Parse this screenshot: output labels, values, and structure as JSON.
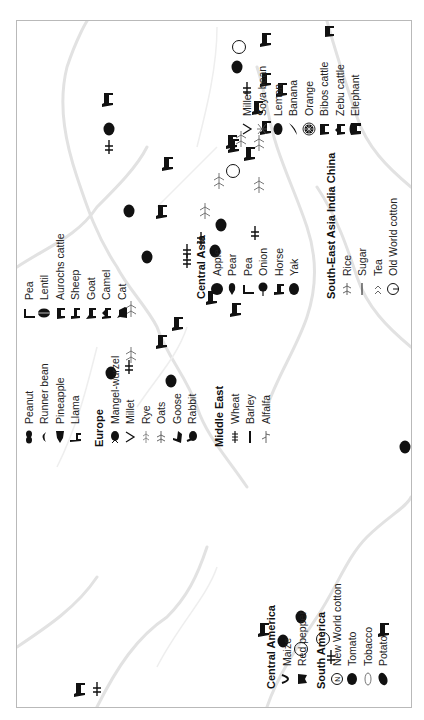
{
  "figure": {
    "orientation": "rotated-90-ccw",
    "frame_color": "#b9b9b9",
    "coastline_color": "#dcdcdc",
    "icon_color": "#111111"
  },
  "legend": {
    "central_america": {
      "title": "Central America",
      "items": [
        {
          "label": "Maize",
          "icon": "maize-icon"
        },
        {
          "label": "Red pepper",
          "icon": "red-pepper-icon"
        }
      ]
    },
    "south_america": {
      "title": "South America",
      "items": [
        {
          "label": "New World cotton",
          "icon": "new-world-cotton-icon"
        },
        {
          "label": "Tomato",
          "icon": "tomato-icon"
        },
        {
          "label": "Tobacco",
          "icon": "tobacco-icon"
        },
        {
          "label": "Potato",
          "icon": "potato-icon"
        }
      ]
    },
    "americas_extra": {
      "items": [
        {
          "label": "Peanut",
          "icon": "peanut-icon"
        },
        {
          "label": "Runner bean",
          "icon": "runner-bean-icon"
        },
        {
          "label": "Pineapple",
          "icon": "pineapple-icon"
        },
        {
          "label": "Llama",
          "icon": "llama-icon"
        }
      ]
    },
    "europe": {
      "title": "Europe",
      "items": [
        {
          "label": "Mangel-wurzel",
          "icon": "mangel-wurzel-icon"
        },
        {
          "label": "Millet",
          "icon": "millet-icon"
        },
        {
          "label": "Rye",
          "icon": "rye-icon"
        },
        {
          "label": "Oats",
          "icon": "oats-icon"
        },
        {
          "label": "Goose",
          "icon": "goose-icon"
        },
        {
          "label": "Rabbit",
          "icon": "rabbit-icon"
        }
      ]
    },
    "middle_east": {
      "title": "Middle East",
      "items": [
        {
          "label": "Wheat",
          "icon": "wheat-icon"
        },
        {
          "label": "Barley",
          "icon": "barley-icon"
        },
        {
          "label": "Alfalfa",
          "icon": "alfalfa-icon"
        }
      ]
    },
    "middle_east_extra": {
      "items": [
        {
          "label": "Pea",
          "icon": "pea-icon"
        },
        {
          "label": "Lentil",
          "icon": "lentil-icon"
        },
        {
          "label": "Aurochs cattle",
          "icon": "aurochs-cattle-icon"
        },
        {
          "label": "Sheep",
          "icon": "sheep-icon"
        },
        {
          "label": "Goat",
          "icon": "goat-icon"
        },
        {
          "label": "Camel",
          "icon": "camel-icon"
        },
        {
          "label": "Cat",
          "icon": "cat-icon"
        }
      ]
    },
    "central_asia": {
      "title": "Central Asia",
      "items": [
        {
          "label": "Apple",
          "icon": "apple-icon"
        },
        {
          "label": "Pear",
          "icon": "pear-icon"
        },
        {
          "label": "Pea",
          "icon": "pea-icon"
        },
        {
          "label": "Onion",
          "icon": "onion-icon"
        },
        {
          "label": "Horse",
          "icon": "horse-icon"
        },
        {
          "label": "Yak",
          "icon": "yak-icon"
        }
      ]
    },
    "south_east_asia": {
      "title": "South-East Asia India China",
      "items": [
        {
          "label": "Rice",
          "icon": "rice-icon"
        },
        {
          "label": "Sugar",
          "icon": "sugar-icon"
        },
        {
          "label": "Tea",
          "icon": "tea-icon"
        },
        {
          "label": "Old World cotton",
          "icon": "old-world-cotton-icon"
        }
      ]
    },
    "asia_extra_1": {
      "items": [
        {
          "label": "Millet",
          "icon": "millet-icon"
        },
        {
          "label": "Soya bean",
          "icon": "soya-bean-icon"
        },
        {
          "label": "Lemon",
          "icon": "lemon-icon"
        },
        {
          "label": "Banana",
          "icon": "banana-icon"
        },
        {
          "label": "Orange",
          "icon": "orange-icon"
        },
        {
          "label": "Bibos cattle",
          "icon": "bibos-cattle-icon"
        },
        {
          "label": "Zebu cattle",
          "icon": "zebu-cattle-icon"
        },
        {
          "label": "Elephant",
          "icon": "elephant-icon"
        }
      ]
    },
    "asia_extra_2": {
      "items": [
        {
          "label": "Water buffalo",
          "icon": "water-buffalo-icon"
        },
        {
          "label": "Dog",
          "icon": "dog-icon"
        },
        {
          "label": "Pig",
          "icon": "pig-icon"
        },
        {
          "label": "Fowl",
          "icon": "fowl-icon"
        },
        {
          "label": "Ass",
          "icon": "ass-icon"
        }
      ]
    }
  },
  "map_icons": [
    {
      "name": "maize-icon",
      "u": 30,
      "v": 96
    },
    {
      "name": "red-pepper-icon",
      "u": 30,
      "v": 78
    },
    {
      "name": "tomato-icon",
      "u": 102,
      "v": 300
    },
    {
      "name": "new-world-cotton-icon",
      "u": 80,
      "v": 322
    },
    {
      "name": "tobacco-icon",
      "u": 70,
      "v": 300
    },
    {
      "name": "potato-icon",
      "u": 78,
      "v": 282
    },
    {
      "name": "runner-bean-icon",
      "u": 90,
      "v": 262
    },
    {
      "name": "peanut-icon",
      "u": 62,
      "v": 330
    },
    {
      "name": "pineapple-icon",
      "u": 272,
      "v": 404
    },
    {
      "name": "llama-icon",
      "u": 90,
      "v": 382
    },
    {
      "name": "mangel-wurzel-icon",
      "u": 346,
      "v": 110
    },
    {
      "name": "millet-icon",
      "u": 352,
      "v": 128
    },
    {
      "name": "rye-icon",
      "u": 364,
      "v": 130
    },
    {
      "name": "oats-icon",
      "u": 410,
      "v": 130
    },
    {
      "name": "goose-icon",
      "u": 378,
      "v": 160
    },
    {
      "name": "rabbit-icon",
      "u": 338,
      "v": 170
    },
    {
      "name": "wheat-icon",
      "u": 458,
      "v": 186
    },
    {
      "name": "barley-icon",
      "u": 468,
      "v": 186
    },
    {
      "name": "alfalfa-icon",
      "u": 508,
      "v": 204
    },
    {
      "name": "pea-icon",
      "u": 480,
      "v": 200
    },
    {
      "name": "lentil-icon",
      "u": 468,
      "v": 214
    },
    {
      "name": "aurochs-cattle-icon",
      "u": 396,
      "v": 176
    },
    {
      "name": "sheep-icon",
      "u": 556,
      "v": 166
    },
    {
      "name": "goat-icon",
      "u": 508,
      "v": 160
    },
    {
      "name": "camel-icon",
      "u": 410,
      "v": 234
    },
    {
      "name": "cat-icon",
      "u": 422,
      "v": 210
    },
    {
      "name": "apple-icon",
      "u": 462,
      "v": 146
    },
    {
      "name": "pear-icon",
      "u": 508,
      "v": 128
    },
    {
      "name": "onion-icon",
      "u": 590,
      "v": 108
    },
    {
      "name": "pea-icon",
      "u": 572,
      "v": 108
    },
    {
      "name": "horse-icon",
      "u": 620,
      "v": 106
    },
    {
      "name": "yak-icon",
      "u": 494,
      "v": 220
    },
    {
      "name": "rice-icon",
      "u": 538,
      "v": 218
    },
    {
      "name": "sugar-icon",
      "u": 580,
      "v": 240
    },
    {
      "name": "tea-icon",
      "u": 576,
      "v": 258
    },
    {
      "name": "old-world-cotton-icon",
      "u": 548,
      "v": 232
    },
    {
      "name": "millet-icon",
      "u": 486,
      "v": 254
    },
    {
      "name": "soya-bean-icon",
      "u": 534,
      "v": 258
    },
    {
      "name": "lemon-icon",
      "u": 652,
      "v": 236
    },
    {
      "name": "banana-icon",
      "u": 630,
      "v": 246
    },
    {
      "name": "orange-icon",
      "u": 672,
      "v": 238
    },
    {
      "name": "bibos-cattle-icon",
      "u": 566,
      "v": 248
    },
    {
      "name": "zebu-cattle-icon",
      "u": 574,
      "v": 232
    },
    {
      "name": "elephant-icon",
      "u": 578,
      "v": 230
    },
    {
      "name": "water-buffalo-icon",
      "u": 630,
      "v": 280
    },
    {
      "name": "dog-icon",
      "u": 612,
      "v": 256
    },
    {
      "name": "pig-icon",
      "u": 640,
      "v": 264
    },
    {
      "name": "fowl-icon",
      "u": 592,
      "v": 264
    },
    {
      "name": "ass-icon",
      "u": 680,
      "v": 264
    }
  ]
}
